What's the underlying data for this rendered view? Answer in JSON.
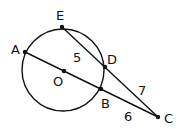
{
  "diagram": {
    "points": {
      "E": {
        "label": "E",
        "x": 62,
        "y": 27
      },
      "A": {
        "label": "A",
        "x": 25,
        "y": 52
      },
      "O": {
        "label": "O",
        "x": 64,
        "y": 71
      },
      "D": {
        "label": "D",
        "x": 105,
        "y": 67
      },
      "B": {
        "label": "B",
        "x": 101,
        "y": 89
      },
      "C": {
        "label": "C",
        "x": 158,
        "y": 117
      }
    },
    "circle": {
      "center": "O",
      "cx": 64,
      "cy": 71,
      "r": 42
    },
    "segments": [
      [
        "E",
        "C"
      ],
      [
        "A",
        "C"
      ]
    ],
    "measures": {
      "ED": "5",
      "DC": "7",
      "BC": "6"
    }
  }
}
